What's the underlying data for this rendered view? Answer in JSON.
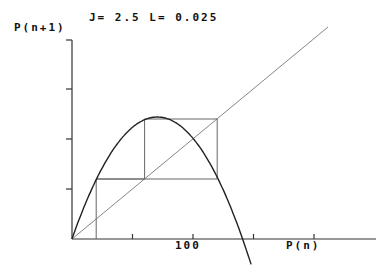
{
  "chart_data": {
    "type": "line",
    "title": "J= 2.5 L= 0.025",
    "parameters": {
      "J": 2.5,
      "L": 0.025
    },
    "xlabel": "P(n)",
    "ylabel": "P(n+1)",
    "x_tick_labels": [
      {
        "value": 100,
        "label": "100"
      }
    ],
    "x_ticks": [
      50,
      100,
      150,
      200
    ],
    "y_ticks": [
      50,
      100,
      150
    ],
    "xlim": [
      0,
      250
    ],
    "ylim": [
      0,
      200
    ],
    "grid": false,
    "series": [
      {
        "name": "map curve P(n+1) vs P(n)",
        "style": "parabola",
        "x": [
          0,
          20,
          40,
          60,
          70,
          80,
          100,
          120,
          141,
          148
        ],
        "y": [
          0,
          58,
          99,
          119,
          122,
          120,
          100,
          61,
          0,
          -23
        ]
      },
      {
        "name": "identity line P(n+1)=P(n)",
        "x": [
          0,
          211
        ],
        "y": [
          0,
          212
        ]
      },
      {
        "name": "cobweb iteration",
        "x": [
          20,
          20,
          60,
          60,
          120,
          120,
          20
        ],
        "y": [
          0,
          60,
          60,
          120,
          120,
          60,
          60
        ]
      }
    ]
  },
  "labels": {
    "title": "J= 2.5 L= 0.025",
    "y_axis": "P(n+1)",
    "x_axis": "P(n)",
    "x_tick_100": "100"
  }
}
